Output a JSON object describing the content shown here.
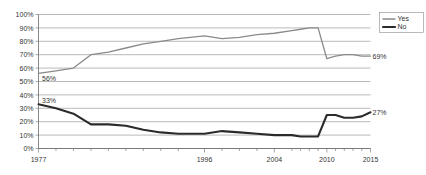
{
  "chart_data": {
    "type": "line",
    "title": "",
    "subtitle": "",
    "xlabel": "",
    "ylabel": "",
    "ylim": [
      0,
      100
    ],
    "ytick_labels": [
      "0%",
      "10%",
      "20%",
      "30%",
      "40%",
      "50%",
      "60%",
      "70%",
      "80%",
      "90%",
      "100%"
    ],
    "ytick_values": [
      0,
      10,
      20,
      30,
      40,
      50,
      60,
      70,
      80,
      90,
      100
    ],
    "grid": true,
    "legend_position": "top-right",
    "x": [
      1977,
      1979,
      1981,
      1983,
      1985,
      1987,
      1989,
      1991,
      1993,
      1996,
      1998,
      2000,
      2002,
      2004,
      2006,
      2007,
      2008,
      2009,
      2010,
      2011,
      2012,
      2013,
      2014,
      2015
    ],
    "xtick_labels": [
      "1977",
      "1996",
      "2004",
      "2010",
      "2015"
    ],
    "xtick_positions": [
      1977,
      1996,
      2004,
      2010,
      2015
    ],
    "series": [
      {
        "name": "Yes",
        "color": "#8a8a8a",
        "values": [
          56,
          58,
          60,
          70,
          72,
          75,
          78,
          80,
          82,
          84,
          82,
          83,
          85,
          86,
          88,
          89,
          90,
          90,
          67,
          69,
          70,
          70,
          69,
          69
        ],
        "start_label": "56%",
        "end_label": "69%"
      },
      {
        "name": "No",
        "color": "#2b2b2b",
        "values": [
          33,
          30,
          26,
          18,
          18,
          17,
          14,
          12,
          11,
          11,
          13,
          12,
          11,
          10,
          10,
          9,
          9,
          9,
          25,
          25,
          23,
          23,
          24,
          27
        ],
        "start_label": "33%",
        "end_label": "27%"
      }
    ]
  },
  "legend": {
    "items": [
      {
        "label": "Yes"
      },
      {
        "label": "No"
      }
    ]
  }
}
